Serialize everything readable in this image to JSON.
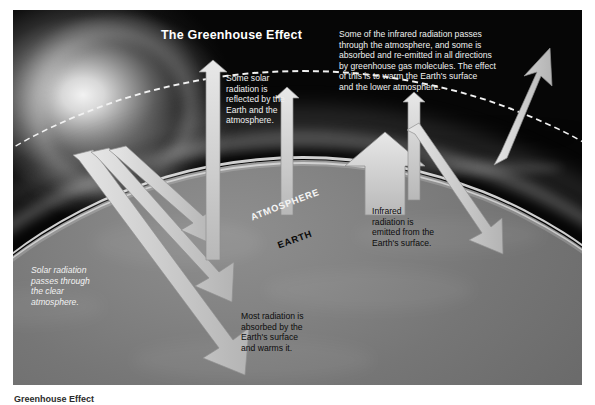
{
  "figure": {
    "title": "The Greenhouse Effect",
    "labels": {
      "atmosphere": "ATMOSPHERE",
      "earth": "EARTH"
    },
    "annotations": {
      "reflected": "Some solar\nradiation is\nreflected by the\nEarth and the\natmosphere.",
      "infrared_passes": "Some of the infrared radiation passes\nthrough the atmosphere, and some is\nabsorbed and re-emitted in all directions\nby greenhouse gas molecules. The effect\nof this is to warm the Earth's surface\nand the lower atmosphere.",
      "solar_passes": "Solar radiation\npasses through\nthe clear\natmosphere.",
      "emitted": "Infrared\nradiation is\nemitted from the\nEarth's surface.",
      "absorbed": "Most radiation is\nabsorbed by the\nEarth's surface\nand warms it."
    },
    "caption": "Greenhouse Effect",
    "colors": {
      "arrow_fill": "#d9d9d9",
      "arrow_shade": "#a8a8a8",
      "sky": "#0a0a0a",
      "earth": "#7a7a7a",
      "dash_line": "#f2f2f2",
      "title_text": "#ffffff",
      "light_text": "#f0f0f0",
      "dark_text": "#0c0c0c"
    }
  }
}
